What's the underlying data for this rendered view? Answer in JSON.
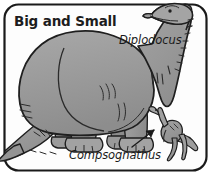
{
  "figure": {
    "title": "Big and Small",
    "kind": "illustration",
    "frame": {
      "shape": "rounded-rectangle",
      "stroke_color": "#1a1a1a",
      "stroke_width_px": 2,
      "corner_radius_px": 14,
      "background_color": "#fdfdfd"
    },
    "palette": {
      "body_fill": "#9a9a9a",
      "body_fill_light": "#aaaaaa",
      "body_fill_dark": "#858585",
      "outline": "#1f1f1f",
      "text": "#1a1a1a",
      "page": "#ffffff"
    },
    "labels": [
      {
        "id": "diplodocus",
        "text": "Diplodocus",
        "style": "italic",
        "role": "species-label",
        "points_to": "large-dinosaur"
      },
      {
        "id": "compsognathus",
        "text": "Compsognathus",
        "style": "italic",
        "role": "species-label",
        "points_to": "small-dinosaur",
        "has_leader_arrow": true
      }
    ],
    "creatures": [
      {
        "id": "large-dinosaur",
        "name": "Diplodocus",
        "description": "very large long-necked sauropod, body fills the frame, small head raised top-right above the frame edge, long tail sweeping off the left edge, four thick columnar legs",
        "relative_size": "big"
      },
      {
        "id": "small-dinosaur",
        "name": "Compsognathus",
        "description": "small bipedal theropod standing at lower right, long tail, small head",
        "relative_size": "small"
      }
    ],
    "annotations": [
      {
        "id": "leader-arrow",
        "kind": "arrow",
        "direction": "up-right",
        "from_label": "Compsognathus",
        "to_creature": "small-dinosaur"
      }
    ]
  }
}
